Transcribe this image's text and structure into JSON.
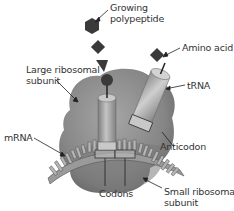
{
  "diagram": {
    "type": "ribosome-translation",
    "labels": {
      "growing_polypeptide": [
        "Growing",
        "polypeptide"
      ],
      "amino_acid": "Amino acid",
      "large_subunit": [
        "Large ribosomal",
        "subunit"
      ],
      "trna": "tRNA",
      "mrna": "mRNA",
      "anticodon": "Anticodon",
      "codons": "Codons",
      "small_subunit": [
        "Small ribosomal",
        "subunit"
      ]
    },
    "colors": {
      "ribosome": "#8a8a8a",
      "ribosome_dark": "#6b6b6b",
      "trna": "#a8a8a8",
      "polypeptide": "#3a3a3a",
      "text": "#333333",
      "background": "#ffffff"
    }
  }
}
